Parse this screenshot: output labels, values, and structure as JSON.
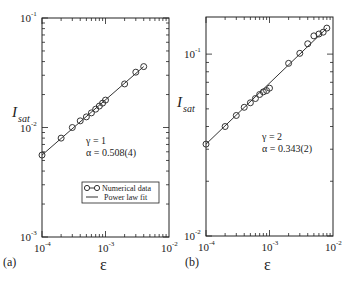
{
  "chart_data": [
    {
      "type": "scatter",
      "panel_label": "(a)",
      "xlabel": "ε",
      "ylabel": "I",
      "ylabel_sub": "sat",
      "xscale": "log",
      "yscale": "log",
      "xlim": [
        0.0001,
        0.01
      ],
      "ylim": [
        0.001,
        0.1
      ],
      "xtick_labels": [
        {
          "base": "10",
          "exp": "-4"
        },
        {
          "base": "10",
          "exp": "-3"
        },
        {
          "base": "10",
          "exp": "-2"
        }
      ],
      "ytick_labels": [
        {
          "base": "10",
          "exp": "-3"
        },
        {
          "base": "10",
          "exp": "-2"
        },
        {
          "base": "10",
          "exp": "-1"
        }
      ],
      "annotations": [
        "γ = 1",
        "α = 0.508(4)"
      ],
      "legend": {
        "placement": "lower-right",
        "entries": [
          "Numerical data",
          "Power law fit"
        ]
      },
      "series": [
        {
          "name": "Numerical data",
          "x": [
            0.0001,
            0.0002,
            0.0003,
            0.0004,
            0.0005,
            0.0006,
            0.0007,
            0.0008,
            0.0009,
            0.001,
            0.002,
            0.003,
            0.004
          ],
          "y": [
            0.0056,
            0.008,
            0.01,
            0.0115,
            0.0125,
            0.0136,
            0.0147,
            0.0157,
            0.0167,
            0.0178,
            0.025,
            0.032,
            0.036
          ]
        },
        {
          "name": "Power law fit",
          "exponent": 0.508,
          "x": [
            0.0001,
            0.004
          ],
          "y": [
            0.0056,
            0.036
          ]
        }
      ]
    },
    {
      "type": "scatter",
      "panel_label": "(b)",
      "xlabel": "ε",
      "ylabel": "I",
      "ylabel_sub": "sat",
      "xscale": "log",
      "yscale": "log",
      "xlim": [
        0.0001,
        0.01
      ],
      "ylim": [
        0.01,
        0.16
      ],
      "xtick_labels": [
        {
          "base": "10",
          "exp": "-4"
        },
        {
          "base": "10",
          "exp": "-3"
        },
        {
          "base": "10",
          "exp": "-2"
        }
      ],
      "ytick_labels": [
        {
          "base": "10",
          "exp": "-2"
        },
        {
          "base": "10",
          "exp": "-1"
        }
      ],
      "annotations": [
        "γ = 2",
        "α = 0.343(2)"
      ],
      "series": [
        {
          "name": "Numerical data",
          "x": [
            0.0001,
            0.0002,
            0.0003,
            0.0004,
            0.0005,
            0.0006,
            0.0007,
            0.0008,
            0.0009,
            0.001,
            0.002,
            0.003,
            0.004,
            0.005,
            0.006,
            0.007,
            0.008
          ],
          "y": [
            0.032,
            0.04,
            0.046,
            0.051,
            0.054,
            0.057,
            0.06,
            0.062,
            0.063,
            0.065,
            0.089,
            0.101,
            0.114,
            0.126,
            0.129,
            0.132,
            0.139
          ]
        },
        {
          "name": "Power law fit",
          "exponent": 0.343,
          "x": [
            0.0001,
            0.008
          ],
          "y": [
            0.032,
            0.139
          ]
        }
      ]
    }
  ]
}
